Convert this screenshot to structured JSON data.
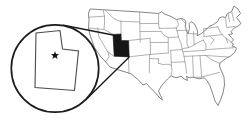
{
  "figure": {
    "type": "locator-map",
    "area": "contiguous United States",
    "highlighted_state": "Utah",
    "callout": {
      "shape": "magnifier-circle",
      "content": "enlarged Utah outline",
      "marker": "star"
    },
    "colors": {
      "background": "#ffffff",
      "state_border": "#8f8f8f",
      "country_outline": "#787878",
      "highlight_fill": "#161616",
      "callout_stroke": "#1d1d1d",
      "callout_state_stroke": "#4a4a4a",
      "star_fill": "#111111"
    }
  }
}
